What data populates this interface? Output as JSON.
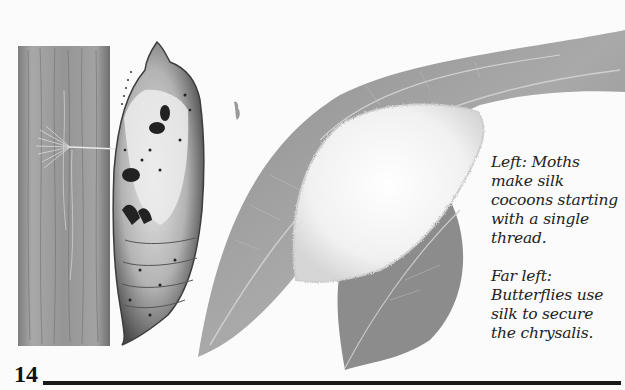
{
  "page": {
    "number": "14"
  },
  "illustrations": {
    "tree_trunk": "tree-bark",
    "chrysalis": "butterfly-chrysalis",
    "silk_thread": "silk-thread",
    "leaves": "leaves",
    "cocoon": "silk-cocoon",
    "small_insect": "small-insect"
  },
  "captions": [
    {
      "lines": [
        "Left:  Moths",
        "make silk",
        "cocoons starting",
        "with a single",
        "thread."
      ]
    },
    {
      "lines": [
        "Far left:",
        "Butterflies use",
        "silk to secure",
        "the chrysalis."
      ]
    }
  ]
}
